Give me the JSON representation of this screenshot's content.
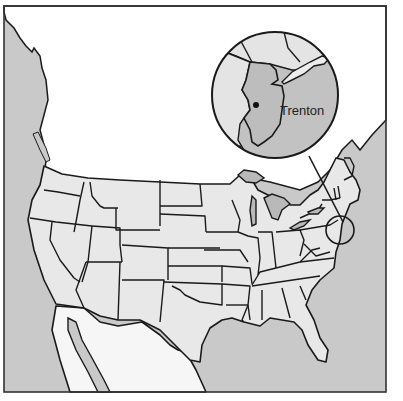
{
  "map": {
    "title": "",
    "subject": "United States with inset of New Jersey",
    "inset": {
      "city_label": "Trenton",
      "city_marker": "dot",
      "highlighted_state": "New Jersey"
    },
    "colors": {
      "water": "#c9c9c9",
      "land": "#e8e8e8",
      "foreign_land": "#f6f6f6",
      "highlight": "#bdbdbd",
      "borders": "#1a1a1a"
    }
  }
}
